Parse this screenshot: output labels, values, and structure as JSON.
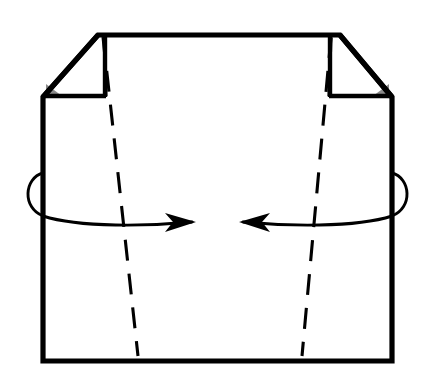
{
  "figure": {
    "type": "origami-fold-diagram",
    "background_color": "#ffffff",
    "line_color": "#000000",
    "wedge_color": "#8a8a8a",
    "paper_color": "#ffffff"
  },
  "geometry": {
    "outer_body": {
      "name": "paper-outline",
      "points": "98,35 340,35 392,97 392,361 43,361 43,97"
    },
    "top_edge": {
      "x1": 98,
      "y1": 35,
      "x2": 340,
      "y2": 35
    },
    "left_vertical_edge": {
      "x1": 43,
      "y1": 97,
      "x2": 43,
      "y2": 361
    },
    "right_vertical_edge": {
      "x1": 392,
      "y1": 97,
      "x2": 392,
      "y2": 361
    },
    "bottom_edge": {
      "x1": 43,
      "y1": 361,
      "x2": 392,
      "y2": 361
    },
    "left_flap": {
      "name": "left-triangular-flap",
      "points": "98,35 43,97 105,97 105,35",
      "diagonal": {
        "x1": 98,
        "y1": 35,
        "x2": 43,
        "y2": 97
      },
      "bottom": {
        "x1": 43,
        "y1": 97,
        "x2": 105,
        "y2": 97
      }
    },
    "right_flap": {
      "name": "right-triangular-flap",
      "points": "340,35 392,97 330,97 330,35",
      "diagonal": {
        "x1": 340,
        "y1": 35,
        "x2": 392,
        "y2": 97
      },
      "bottom": {
        "x1": 392,
        "y1": 97,
        "x2": 330,
        "y2": 97
      }
    },
    "left_corner_wedge": {
      "points": "46,96 62,96 46,84"
    },
    "right_corner_wedge": {
      "points": "389,96 373,96 389,84"
    },
    "left_fold_line": {
      "x1": 103,
      "y1": 37,
      "x2": 138,
      "y2": 356
    },
    "right_fold_line": {
      "x1": 331,
      "y1": 37,
      "x2": 302,
      "y2": 356
    },
    "left_flap_fold_line": {
      "x1": 104,
      "y1": 38,
      "x2": 106,
      "y2": 96
    },
    "right_flap_fold_line": {
      "x1": 331,
      "y1": 38,
      "x2": 329,
      "y2": 96
    }
  },
  "annotations": {
    "left_rotation_arrow": {
      "name": "fold-arrow-left",
      "label": "rotate left panel inward",
      "direction": "right",
      "arc_path": "M 43,173 C 24,178 22,208 43,216 C 80,228 150,226 192,222",
      "tip_x": 196,
      "tip_y": 222,
      "head_points": "196,222 165,213 173,222 165,232"
    },
    "right_rotation_arrow": {
      "name": "fold-arrow-right",
      "label": "rotate right panel inward",
      "direction": "left",
      "arc_path": "M 392,173 C 411,178 413,208 392,216 C 355,228 285,226 243,222",
      "tip_x": 239,
      "tip_y": 222,
      "head_points": "239,222 270,213 262,222 270,232"
    }
  }
}
